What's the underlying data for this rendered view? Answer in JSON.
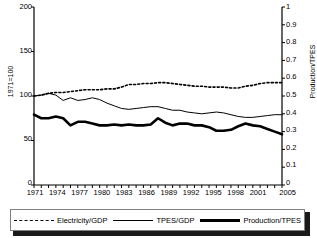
{
  "chart_data": {
    "type": "line",
    "title": "",
    "xlabel": "",
    "ylabel": "1971=100",
    "ylabel_right": "Production/TPES",
    "ylim": [
      0,
      200
    ],
    "ylim_right": [
      0,
      1
    ],
    "grid": false,
    "legend_position": "bottom",
    "x": [
      1971,
      1972,
      1973,
      1974,
      1975,
      1976,
      1977,
      1978,
      1979,
      1980,
      1981,
      1982,
      1983,
      1984,
      1985,
      1986,
      1987,
      1988,
      1989,
      1990,
      1991,
      1992,
      1993,
      1994,
      1995,
      1996,
      1997,
      1998,
      1999,
      2000,
      2001,
      2002,
      2003,
      2004,
      2005
    ],
    "xtick_labels": [
      "1971",
      "1974",
      "1977",
      "1980",
      "1983",
      "1986",
      "1989",
      "1992",
      "1995",
      "1998",
      "2001",
      "2005"
    ],
    "ytick_labels_left": [
      "200",
      "150",
      "100",
      "50",
      "0"
    ],
    "ytick_labels_right": [
      "1",
      "0.9",
      "0.8",
      "0.7",
      "0.6",
      "0.5",
      "0.4",
      "0.3",
      "0.2",
      "0.1",
      "0"
    ],
    "series": [
      {
        "name": "Electricity/GDP",
        "axis": "left",
        "style": "dotted",
        "values": [
          100,
          101,
          103,
          104,
          104,
          105,
          106,
          107,
          107,
          107,
          108,
          108,
          110,
          113,
          113,
          114,
          114,
          115,
          115,
          114,
          113,
          112,
          111,
          111,
          110,
          110,
          110,
          109,
          109,
          111,
          112,
          114,
          115,
          115,
          115
        ]
      },
      {
        "name": "TPES/GDP",
        "axis": "left",
        "style": "thin",
        "values": [
          100,
          101,
          103,
          101,
          95,
          98,
          95,
          96,
          98,
          96,
          92,
          89,
          86,
          85,
          86,
          87,
          88,
          88,
          86,
          84,
          84,
          82,
          81,
          80,
          81,
          82,
          81,
          79,
          77,
          76,
          76,
          77,
          78,
          79,
          79
        ]
      },
      {
        "name": "Production/TPES",
        "axis": "right",
        "style": "thick",
        "values": [
          0.395,
          0.375,
          0.375,
          0.385,
          0.375,
          0.335,
          0.355,
          0.355,
          0.345,
          0.335,
          0.335,
          0.34,
          0.335,
          0.34,
          0.335,
          0.335,
          0.34,
          0.375,
          0.35,
          0.335,
          0.345,
          0.345,
          0.335,
          0.335,
          0.325,
          0.305,
          0.305,
          0.31,
          0.33,
          0.345,
          0.335,
          0.33,
          0.315,
          0.3,
          0.285
        ]
      }
    ]
  },
  "axes": {
    "left_label": "1971=100",
    "right_label": "Production/TPES"
  },
  "legend": {
    "items": [
      {
        "label": "Electricity/GDP",
        "style": "dotted"
      },
      {
        "label": "TPES/GDP",
        "style": "thin"
      },
      {
        "label": "Production/TPES",
        "style": "thick"
      }
    ]
  }
}
